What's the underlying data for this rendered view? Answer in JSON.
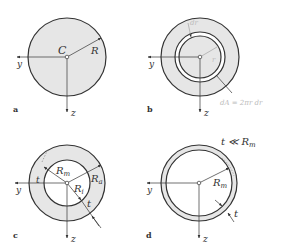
{
  "colors": {
    "fill": "#e6e6e6",
    "stroke": "#333333",
    "faint": "#bbbbbb",
    "background": "#ffffff"
  },
  "panels": [
    {
      "id": "a",
      "label": "a",
      "axes": {
        "y": "y",
        "z": "z"
      },
      "center_label": "C",
      "radius_label": "R"
    },
    {
      "id": "b",
      "label": "b",
      "axes": {
        "y": "y",
        "z": "z"
      },
      "ring_width_label": "dr",
      "radius_label": "r",
      "area_formula": "dA = 2πr dr"
    },
    {
      "id": "c",
      "label": "c",
      "axes": {
        "y": "y",
        "z": "z"
      },
      "mean_radius_label": "R",
      "mean_radius_sub": "m",
      "outer_radius_label": "R",
      "outer_radius_sub": "a",
      "inner_radius_label": "R",
      "inner_radius_sub": "i",
      "thickness_label": "t",
      "thickness_label_2": "t"
    },
    {
      "id": "d",
      "label": "d",
      "axes": {
        "y": "y",
        "z": "z"
      },
      "condition": "t ≪ R",
      "condition_sub": "m",
      "mean_radius_label": "R",
      "mean_radius_sub": "m",
      "thickness_label": "t"
    }
  ]
}
